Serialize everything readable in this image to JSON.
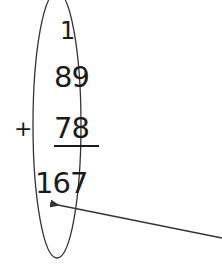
{
  "diagram": {
    "type": "column-addition",
    "carry": "1",
    "addend_1": "89",
    "operator": "+",
    "addend_2": "78",
    "sum": "167",
    "highlight": "ellipse around tens column",
    "annotation": "arrow pointing to tens column of the sum",
    "colors": {
      "ink": "#1a1a1a",
      "background": "#ffffff",
      "arrow": "#333333"
    }
  }
}
